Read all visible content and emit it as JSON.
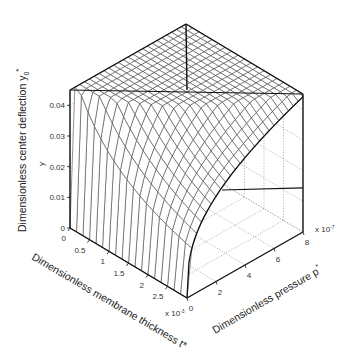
{
  "chart_data": {
    "type": "surface3d",
    "title": "",
    "zlabel": "Dimensionless center deflection y0*",
    "zlabel_inner": "y0*",
    "xlabel": "Dimensionless membrane thickness t*",
    "ylabel": "Dimensionless pressure p*",
    "x_axis": {
      "ticks": [
        "0",
        "0.5",
        "1",
        "1.5",
        "2",
        "2.5"
      ],
      "multiplier": "x 10^-3",
      "range": [
        0,
        0.003
      ]
    },
    "y_axis": {
      "ticks": [
        "0",
        "2",
        "4",
        "6",
        "8"
      ],
      "multiplier": "x 10^-7",
      "range": [
        0,
        8e-07
      ]
    },
    "z_axis": {
      "ticks": [
        "0",
        "0.01",
        "0.02",
        "0.03",
        "0.04"
      ],
      "range": [
        0,
        0.045
      ]
    },
    "grid": true,
    "surface_description": "Deflection is large for thin membranes and high pressure, decreasing with thickness; at maximum thickness deflection rises with pressure along a concave curve."
  },
  "labels": {
    "z_axis_title": "Dimensionless center deflection y",
    "z_axis_sub": "0",
    "z_axis_sup": "*",
    "z_inner": "y",
    "x_axis_title": "Dimensionless membrane thickness t*",
    "y_axis_title": "Dimensionless pressure p",
    "y_axis_sup": "*",
    "x_mult": "x 10",
    "x_mult_exp": "-3",
    "y_mult": "x 10",
    "y_mult_exp": "-7"
  }
}
